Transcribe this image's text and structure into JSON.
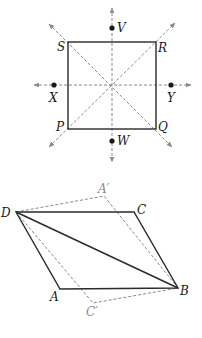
{
  "figures": [
    {
      "name": "square-symmetry",
      "description": "Square PQRS with lines of symmetry (two diagonals, vertical and horizontal axes) and points V, W, X, Y",
      "vertices": {
        "S": [
          68,
          42
        ],
        "R": [
          156,
          42
        ],
        "Q": [
          156,
          129
        ],
        "P": [
          68,
          129
        ]
      },
      "center": [
        112,
        85
      ],
      "points": {
        "V": [
          112,
          28
        ],
        "W": [
          112,
          140
        ],
        "X": [
          54,
          85
        ],
        "Y": [
          171,
          85
        ]
      },
      "labels": {
        "S": "S",
        "R": "R",
        "Q": "Q",
        "P": "P",
        "V": "V",
        "W": "W",
        "X": "X",
        "Y": "Y"
      }
    },
    {
      "name": "parallelogram-reflection",
      "description": "Parallelogram ABCD with diagonal DB and its reflection (dashed) across DB giving A' and C'",
      "vertices": {
        "D": [
          16,
          212
        ],
        "C": [
          134,
          212
        ],
        "B": [
          178,
          288
        ],
        "A": [
          60,
          289
        ]
      },
      "reflected": {
        "A'": [
          104,
          195
        ],
        "C'": [
          93,
          303
        ]
      },
      "labels": {
        "D": "D",
        "C": "C",
        "B": "B",
        "A": "A",
        "A_prime": "A′",
        "C_prime": "C′"
      }
    }
  ],
  "colors": {
    "solid": "#2a2a2a",
    "dashed": "#8a8a8a",
    "label": "#1a1a1a",
    "label_gray": "#8a8a8a"
  }
}
